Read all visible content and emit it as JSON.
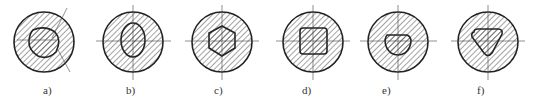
{
  "figures": [
    {
      "label": "a)",
      "shape": "cam-oval-with-tilted-axis",
      "cx": 44,
      "lbl_x": 43
    },
    {
      "label": "b)",
      "shape": "ellipse",
      "cx": 133,
      "lbl_x": 126
    },
    {
      "label": "c)",
      "shape": "hexagon",
      "cx": 222,
      "lbl_x": 214
    },
    {
      "label": "d)",
      "shape": "rounded-square",
      "cx": 313,
      "lbl_x": 302
    },
    {
      "label": "e)",
      "shape": "d-shape-flat-top",
      "cx": 398,
      "lbl_x": 382
    },
    {
      "label": "f)",
      "shape": "rounded-triangle",
      "cx": 488,
      "lbl_x": 477
    }
  ]
}
